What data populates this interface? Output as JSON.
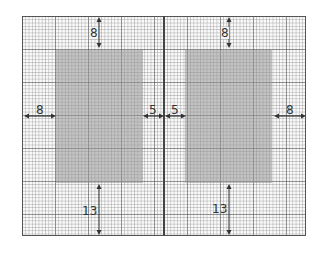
{
  "diagram": {
    "colors": {
      "grid_major": "#5a5a5a",
      "grid_minor": "#8c8c8c",
      "text_block": "#a8a8a8",
      "border": "#555555",
      "arrow": "#333333"
    },
    "left_page": {
      "margins": {
        "top": "8",
        "inner": "5",
        "outer": "8",
        "bottom": "13"
      }
    },
    "right_page": {
      "margins": {
        "top": "8",
        "inner": "5",
        "outer": "8",
        "bottom": "13"
      }
    }
  }
}
